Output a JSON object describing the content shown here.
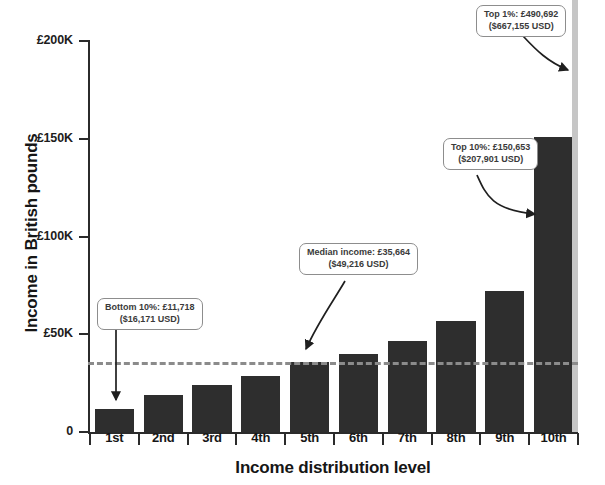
{
  "chart_data": {
    "type": "bar",
    "title": "",
    "xlabel": "Income distribution level",
    "ylabel": "Income in British pounds",
    "categories": [
      "1st",
      "2nd",
      "3rd",
      "4th",
      "5th",
      "6th",
      "7th",
      "8th",
      "9th",
      "10th"
    ],
    "values": [
      11718,
      19000,
      24000,
      28500,
      35664,
      40000,
      46500,
      57000,
      72000,
      150653
    ],
    "ylim": [
      0,
      200000
    ],
    "ytick_labels": [
      "0",
      "£50K",
      "£100K",
      "£150K",
      "£200K"
    ],
    "ytick_values": [
      0,
      50000,
      100000,
      150000,
      200000
    ],
    "grid": false,
    "legend": "none",
    "bar_color": "#2e2e2e",
    "reference_line": {
      "name": "median-income",
      "value": 35664,
      "style": "dashed",
      "color": "#8b8b8b"
    },
    "overflow_bar": {
      "name": "top-1-percent-bar",
      "value": 490692,
      "color": "#c6c6c6"
    },
    "annotations": [
      {
        "name": "bottom-10-callout",
        "line1": "Bottom 10%: £11,718",
        "line2": "($16,171 USD)",
        "points_to": "1st"
      },
      {
        "name": "median-callout",
        "line1": "Median income: £35,664",
        "line2": "($49,216 USD)",
        "points_to": "5th"
      },
      {
        "name": "top-10-callout",
        "line1": "Top 10%: £150,653",
        "line2": "($207,901 USD)",
        "points_to": "10th"
      },
      {
        "name": "top-1-callout",
        "line1": "Top 1%: £490,692",
        "line2": "($667,155 USD)",
        "points_to": "top-1-percent-bar"
      }
    ]
  },
  "axes": {
    "y_title": "Income in British pounds",
    "x_title": "Income distribution level"
  }
}
